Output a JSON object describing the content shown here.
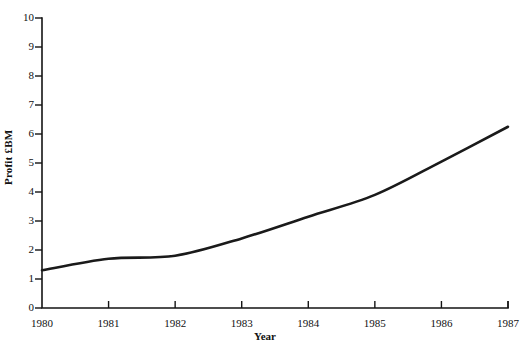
{
  "chart_data": {
    "type": "line",
    "title": "",
    "subtitle": "",
    "xlabel": "Year",
    "ylabel": "Profit £BM",
    "categories": [
      "1980",
      "1981",
      "1982",
      "1983",
      "1984",
      "1985",
      "1986",
      "1987"
    ],
    "x": [
      1980,
      1981,
      1982,
      1983,
      1984,
      1985,
      1986,
      1987
    ],
    "values": [
      1.3,
      1.7,
      1.8,
      2.4,
      3.15,
      3.9,
      5.05,
      6.25
    ],
    "series": [
      {
        "name": "Profit",
        "values": [
          1.3,
          1.7,
          1.8,
          2.4,
          3.15,
          3.9,
          5.05,
          6.25
        ],
        "color": "#1a1a1a"
      }
    ],
    "xlim": [
      1980,
      1987
    ],
    "ylim": [
      0,
      10
    ],
    "ytick_labels": [
      "0",
      "1",
      "2",
      "3",
      "4",
      "5",
      "6",
      "7",
      "8",
      "9",
      "10"
    ],
    "yticks": [
      0,
      1,
      2,
      3,
      4,
      5,
      6,
      7,
      8,
      9,
      10
    ],
    "xtick_labels": [
      "1980",
      "1981",
      "1982",
      "1983",
      "1984",
      "1985",
      "1986",
      "1987"
    ],
    "grid": false,
    "legend": false,
    "legend_position": "none",
    "annotations": []
  },
  "axis": {
    "y_title": "Profit £BM",
    "x_title": "Year"
  },
  "colors": {
    "line": "#1a1a1a",
    "axis": "#141414",
    "background": "#ffffff",
    "text": "#111111"
  }
}
